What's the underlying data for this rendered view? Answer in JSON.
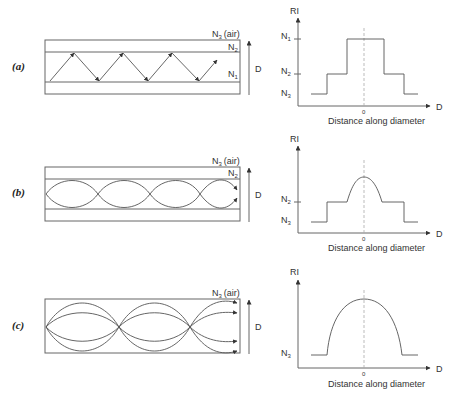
{
  "figure": {
    "panels": [
      {
        "id": "a",
        "label": "(a)",
        "fiber": {
          "type": "step-index multimode",
          "labels": {
            "outer": "N3 (air)",
            "cladding": "N2",
            "core": "N1",
            "diameter": "D"
          },
          "ray_path": "zigzag total internal reflection"
        },
        "profile": {
          "y_axis": "RI",
          "x_axis": "D",
          "x_caption": "Distance along diameter",
          "origin": "0",
          "levels": [
            "N1",
            "N2",
            "N3"
          ],
          "shape": "step"
        }
      },
      {
        "id": "b",
        "label": "(b)",
        "fiber": {
          "type": "graded-index multimode",
          "labels": {
            "outer": "N3 (air)",
            "cladding": "N2",
            "diameter": "D"
          },
          "ray_path": "sinusoidal curved rays"
        },
        "profile": {
          "y_axis": "RI",
          "x_axis": "D",
          "x_caption": "Distance along diameter",
          "origin": "0",
          "levels": [
            "N2",
            "N3"
          ],
          "shape": "graded core with step cladding"
        }
      },
      {
        "id": "c",
        "label": "(c)",
        "fiber": {
          "type": "graded-index (no cladding)",
          "labels": {
            "outer": "N3 (air)",
            "diameter": "D"
          },
          "ray_path": "multiple sinusoidal rays converging at nodes"
        },
        "profile": {
          "y_axis": "RI",
          "x_axis": "D",
          "x_caption": "Distance along diameter",
          "origin": "0",
          "levels": [
            "N3"
          ],
          "shape": "parabolic"
        }
      }
    ]
  },
  "text": {
    "a_label": "(a)",
    "b_label": "(b)",
    "c_label": "(c)",
    "n": "N",
    "s1": "1",
    "s2": "2",
    "s3": "3",
    "air": "(air)",
    "d": "D",
    "ri": "RI",
    "zero": "0",
    "caption": "Distance along diameter"
  }
}
